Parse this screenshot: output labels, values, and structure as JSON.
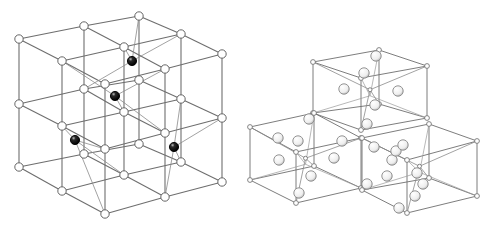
{
  "figure": {
    "colors": {
      "background": "#ffffff",
      "line": "#6e6e6e",
      "node_fill": "#ffffff",
      "node_stroke": "#555555",
      "dark_atom": "#111111",
      "light_atom": "#f2f2f2"
    }
  },
  "left_lattice": {
    "name": "2x2x2 cubic lattice with interstitial dark atoms",
    "nodes": [
      [
        19,
        39
      ],
      [
        84,
        26
      ],
      [
        139,
        16
      ],
      [
        62,
        61
      ],
      [
        124,
        47
      ],
      [
        181,
        34
      ],
      [
        105,
        84
      ],
      [
        165,
        69
      ],
      [
        222,
        54
      ],
      [
        19,
        104
      ],
      [
        84,
        89
      ],
      [
        139,
        80
      ],
      [
        62,
        126
      ],
      [
        124,
        112
      ],
      [
        181,
        99
      ],
      [
        105,
        149
      ],
      [
        165,
        133
      ],
      [
        222,
        118
      ],
      [
        19,
        167
      ],
      [
        84,
        154
      ],
      [
        139,
        144
      ],
      [
        62,
        191
      ],
      [
        124,
        175
      ],
      [
        181,
        162
      ],
      [
        105,
        214
      ],
      [
        165,
        197
      ],
      [
        222,
        182
      ]
    ],
    "dark_atoms": [
      [
        132,
        61
      ],
      [
        115,
        96
      ],
      [
        75,
        140
      ],
      [
        174,
        147
      ]
    ]
  },
  "right_lattice": {
    "name": "Three-cube diamond-type lattice with tetrahedral atoms",
    "corners": [
      [
        313,
        62
      ],
      [
        379,
        50
      ],
      [
        427,
        66
      ],
      [
        361,
        78
      ],
      [
        313,
        113
      ],
      [
        427,
        118
      ],
      [
        250,
        127
      ],
      [
        314,
        113
      ],
      [
        361,
        138
      ],
      [
        296,
        152
      ],
      [
        250,
        180
      ],
      [
        296,
        203
      ],
      [
        361,
        187
      ],
      [
        389,
        129
      ],
      [
        477,
        141
      ],
      [
        407,
        160
      ],
      [
        477,
        196
      ],
      [
        407,
        213
      ],
      [
        362,
        118
      ]
    ],
    "light_atoms": [
      [
        376,
        56
      ],
      [
        364,
        73
      ],
      [
        344,
        89
      ],
      [
        398,
        91
      ],
      [
        375,
        105
      ],
      [
        367,
        124
      ],
      [
        309,
        119
      ],
      [
        278,
        138
      ],
      [
        298,
        141
      ],
      [
        279,
        160
      ],
      [
        311,
        176
      ],
      [
        299,
        193
      ],
      [
        342,
        141
      ],
      [
        334,
        158
      ],
      [
        374,
        147
      ],
      [
        392,
        160
      ],
      [
        387,
        176
      ],
      [
        367,
        184
      ],
      [
        396,
        151
      ],
      [
        417,
        173
      ],
      [
        423,
        184
      ],
      [
        415,
        196
      ],
      [
        399,
        208
      ],
      [
        403,
        145
      ]
    ]
  }
}
